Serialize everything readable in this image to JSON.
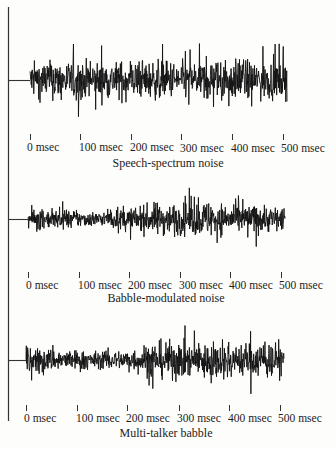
{
  "chart_data": [
    {
      "type": "line",
      "title": "Speech-spectrum noise",
      "xlabel": "",
      "ylabel": "",
      "x_tick_labels": [
        "0 msec",
        "100 msec",
        "200 msec",
        "300 msec",
        "400 msec",
        "500 msec"
      ],
      "x_range_msec": [
        0,
        500
      ],
      "grid": false,
      "description": "Stationary noise waveform with roughly constant amplitude envelope over 500 msec",
      "envelope": [
        0.75,
        0.8,
        0.8,
        0.78,
        0.8,
        0.8,
        0.78,
        0.8,
        0.82,
        0.8,
        0.78
      ]
    },
    {
      "type": "line",
      "title": "Babble-modulated noise",
      "xlabel": "",
      "ylabel": "",
      "x_tick_labels": [
        "0 msec",
        "100 msec",
        "200 msec",
        "300 msec",
        "400 msec",
        "500 msec"
      ],
      "x_range_msec": [
        0,
        500
      ],
      "grid": false,
      "description": "Noise waveform with amplitude modulated by babble envelope; lower at 100-200 msec, peaks near 250 and 330 msec",
      "envelope": [
        0.45,
        0.4,
        0.35,
        0.3,
        0.45,
        0.7,
        0.65,
        0.75,
        0.6,
        0.6,
        0.55
      ]
    },
    {
      "type": "line",
      "title": "Multi-talker babble",
      "xlabel": "",
      "ylabel": "",
      "x_tick_labels": [
        "0 msec",
        "100 msec",
        "200 msec",
        "300 msec",
        "400 msec",
        "500 msec"
      ],
      "x_range_msec": [
        0,
        500
      ],
      "grid": false,
      "description": "Speech babble waveform; moderate amplitude 0-200 msec, larger from 200-500 msec",
      "envelope": [
        0.55,
        0.45,
        0.4,
        0.35,
        0.45,
        0.8,
        0.75,
        0.75,
        0.7,
        0.75,
        0.7
      ]
    }
  ],
  "panels": [
    {
      "title": "Speech-spectrum noise",
      "ticks": [
        "0 msec",
        "100 msec",
        "200 msec",
        "300 msec",
        "400 msec",
        "500 msec"
      ]
    },
    {
      "title": "Babble-modulated noise",
      "ticks": [
        "0 msec",
        "100 msec",
        "200 msec",
        "300 msec",
        "400 msec",
        "500 msec"
      ]
    },
    {
      "title": "Multi-talker babble",
      "ticks": [
        "0 msec",
        "100 msec",
        "200 msec",
        "300 msec",
        "400 msec",
        "500 msec"
      ]
    }
  ]
}
